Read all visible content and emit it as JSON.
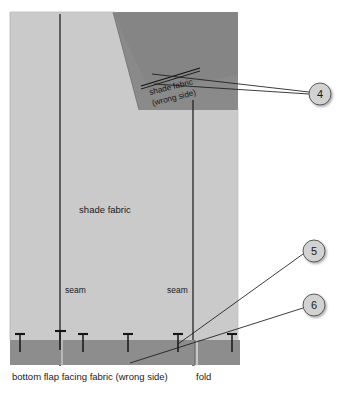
{
  "figure": {
    "type": "sewing-technical-illustration"
  },
  "colors": {
    "page_background": "#ffffff",
    "shade_fabric_light": "#cccccc",
    "shade_fabric_wrong_side": "#8a8a8a",
    "bottom_flap_band": "#8f8f8f",
    "outline": "#1a1a1a",
    "callout_fill": "#d2d2d2",
    "callout_stroke": "#4a4a4a",
    "text": "#1a1a1a",
    "panel_border": "#d8d8d8"
  },
  "labels": {
    "shade_fabric_main": "shade fabric",
    "shade_fabric_wrong_line1": "shade fabric",
    "shade_fabric_wrong_line2": "(wrong side)",
    "seam_left": "seam",
    "seam_right": "seam",
    "bottom_flap": "bottom flap facing fabric (wrong side)",
    "fold": "fold"
  },
  "callouts": [
    {
      "number": "4",
      "cx": 320,
      "cy": 94,
      "r": 11
    },
    {
      "number": "5",
      "cx": 314,
      "cy": 251,
      "r": 11
    },
    {
      "number": "6",
      "cx": 314,
      "cy": 305,
      "r": 11
    }
  ],
  "leader_lines": [
    {
      "from_callout": "4",
      "x1": 309,
      "y1": 94,
      "x2": 151,
      "y2": 77,
      "target": "wrong-side-fold-edge"
    },
    {
      "from_callout": "4",
      "x1": 309,
      "y1": 94,
      "x2": 154,
      "y2": 83,
      "target": "wrong-side-fold-edge-lower"
    },
    {
      "from_callout": "5",
      "x1": 303,
      "y1": 253,
      "x2": 178,
      "y2": 344,
      "target": "pin-at-seam"
    },
    {
      "from_callout": "6",
      "x1": 303,
      "y1": 307,
      "x2": 130,
      "y2": 363,
      "target": "bottom-flap-edge"
    }
  ],
  "pins": [
    {
      "x": 20,
      "y": 337
    },
    {
      "x": 60,
      "y": 335
    },
    {
      "x": 83,
      "y": 337
    },
    {
      "x": 128,
      "y": 337
    },
    {
      "x": 178,
      "y": 337
    },
    {
      "x": 232,
      "y": 337
    }
  ],
  "seam_lines": [
    {
      "name": "seam-left",
      "x": 60,
      "y_top": 14,
      "y_bottom": 366
    },
    {
      "name": "seam-right",
      "x": 193,
      "y_top": 100,
      "y_bottom": 366
    }
  ],
  "fold_line": {
    "name": "fold",
    "x": 197,
    "y_top": 340,
    "y_bottom": 366
  },
  "geometry": {
    "panel": {
      "x": 10,
      "y": 12,
      "width": 228,
      "height": 328
    },
    "band": {
      "x": 10,
      "y": 340,
      "width": 230,
      "height": 25
    },
    "wrong_side_triangle": "M 113,12 L 238,12 L 238,108 L 140,108 Z"
  }
}
